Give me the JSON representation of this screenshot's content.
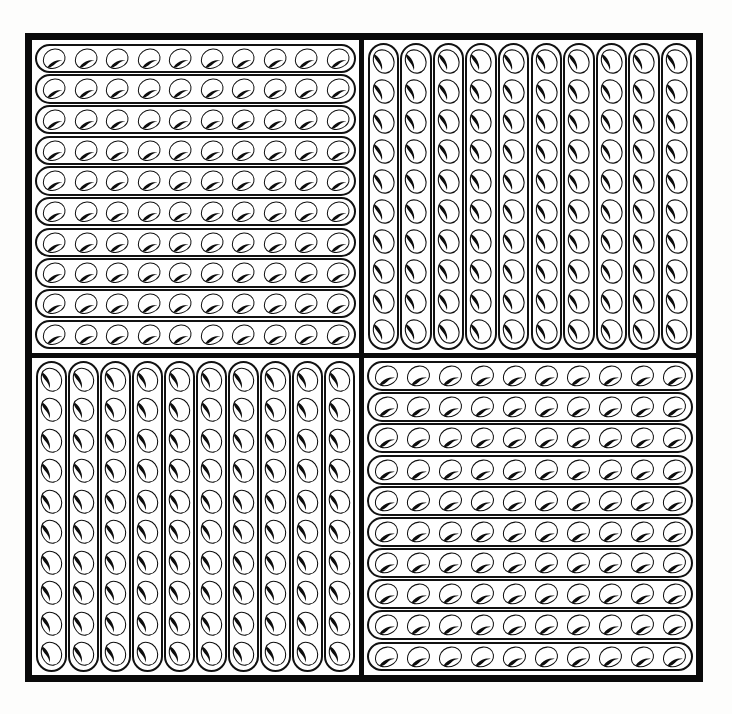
{
  "figure": {
    "canvas": {
      "width": 732,
      "height": 714,
      "background": "#fdfdfc"
    },
    "frame": {
      "name": "outer-frame",
      "stroke_color": "#0a0a0a",
      "stroke_width_px": 7,
      "divider_stroke_width_px": 5,
      "fill": "#ffffff"
    },
    "motif": {
      "name": "bean-shape",
      "description": "rounded comma / kidney bean outline with a solid dark inner notch",
      "outline_color": "#101010",
      "notch_color": "#0d0d0d",
      "fill_color": "#ffffff"
    },
    "grid": {
      "rows": 2,
      "columns": 2,
      "quadrant_count": 4
    },
    "totals": {
      "beans_per_line": 10,
      "lines_per_quadrant": 10,
      "beans_per_quadrant": 100,
      "beans_total": 400
    },
    "quadrants": [
      {
        "id": "top-left",
        "label": "Top left quadrant",
        "packing": "horizontal",
        "orientation_deg": 0,
        "lines": 10,
        "beans_per_line": 10,
        "bean_count": 100,
        "line_shape": "stadium-pill"
      },
      {
        "id": "top-right",
        "label": "Top right quadrant",
        "packing": "vertical",
        "orientation_deg": 90,
        "lines": 10,
        "beans_per_line": 10,
        "bean_count": 100,
        "line_shape": "stadium-pill"
      },
      {
        "id": "bottom-left",
        "label": "Bottom left quadrant",
        "packing": "vertical",
        "orientation_deg": 90,
        "lines": 10,
        "beans_per_line": 10,
        "bean_count": 100,
        "line_shape": "stadium-pill"
      },
      {
        "id": "bottom-right",
        "label": "Bottom right quadrant",
        "packing": "horizontal",
        "orientation_deg": 0,
        "lines": 10,
        "beans_per_line": 10,
        "bean_count": 100,
        "line_shape": "stadium-pill"
      }
    ]
  }
}
